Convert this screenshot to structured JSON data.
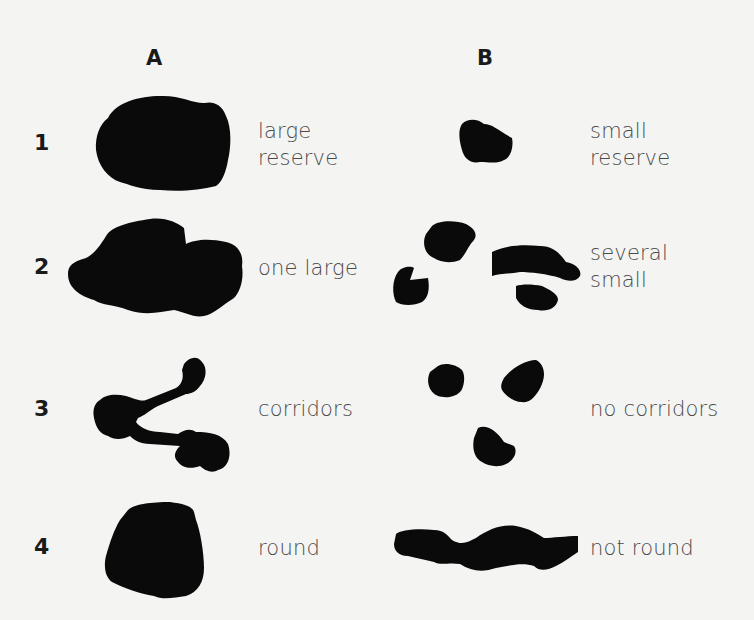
{
  "columns": [
    {
      "id": "A",
      "label": "A"
    },
    {
      "id": "B",
      "label": "B"
    }
  ],
  "rows": [
    {
      "number": "1",
      "a_label": [
        "large",
        "reserve"
      ],
      "b_label": [
        "small",
        "reserve"
      ]
    },
    {
      "number": "2",
      "a_label": [
        "one large"
      ],
      "b_label": [
        "several",
        "small"
      ]
    },
    {
      "number": "3",
      "a_label": [
        "corridors"
      ],
      "b_label": [
        "no corridors"
      ]
    },
    {
      "number": "4",
      "a_label": [
        "round"
      ],
      "b_label": [
        "not round"
      ]
    }
  ],
  "shapes": {
    "row1_a": "large-single-blob",
    "row1_b": "small-single-blob",
    "row2_a": "one-large-blob",
    "row2_b": "four-small-blobs",
    "row3_a": "three-blobs-linked-by-corridors",
    "row3_b": "three-separate-blobs",
    "row4_a": "round-blob",
    "row4_b": "elongated-blob"
  },
  "colors": {
    "background": "#f4f4f3",
    "shape_fill": "#0a0a0a",
    "label_text": "#4a4a4a",
    "heading_text": "#1a1a1a"
  }
}
